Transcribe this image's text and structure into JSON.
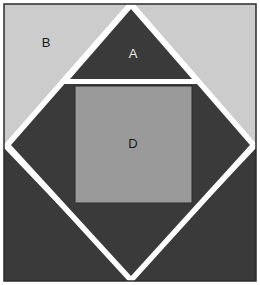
{
  "figure": {
    "width": 260,
    "height": 285,
    "background_color": "#ffffff",
    "frame": {
      "name": "outer-frame",
      "x": 4,
      "y": 4,
      "width": 252,
      "height": 277,
      "stroke_color": "#2b2b2b",
      "stroke_width": 1.5,
      "fill_color": "#ffffff"
    },
    "colors": {
      "light_gray": "#cccccc",
      "dark_gray": "#3a3a3a",
      "medium_gray": "#9a9a9a",
      "gap_white": "#ffffff",
      "outline": "#2b2b2b",
      "label_light": "#e8e8e8",
      "label_dark": "#1a1a1a"
    },
    "regions": [
      {
        "id": "corner-top-left",
        "name": "corner-top-left-triangle",
        "label": "B",
        "fill": "#cccccc",
        "points": "4,4 131,4 4,148",
        "label_x": 46,
        "label_y": 44,
        "label_color": "#1a1a1a"
      },
      {
        "id": "corner-top-right",
        "name": "corner-top-right-triangle",
        "label": "",
        "fill": "#cccccc",
        "points": "131,4 256,4 256,148",
        "label_x": 0,
        "label_y": 0,
        "label_color": "#1a1a1a"
      },
      {
        "id": "corner-bottom-left",
        "name": "corner-bottom-left-triangle",
        "label": "",
        "fill": "#3a3a3a",
        "points": "4,148 4,281 131,281",
        "label_x": 0,
        "label_y": 0,
        "label_color": "#e8e8e8"
      },
      {
        "id": "corner-bottom-right",
        "name": "corner-bottom-right-triangle",
        "label": "",
        "fill": "#3a3a3a",
        "points": "256,148 256,281 131,281",
        "label_x": 0,
        "label_y": 0,
        "label_color": "#e8e8e8"
      },
      {
        "id": "inner-diamond",
        "name": "inner-rotated-square",
        "label": "",
        "fill": "#3a3a3a",
        "points": "131,8 250,145 131,276 11,145",
        "label_x": 0,
        "label_y": 0,
        "label_color": "#e8e8e8"
      },
      {
        "id": "triangle-a",
        "name": "triangle-a",
        "label": "A",
        "fill": "#3a3a3a",
        "points": "131,9 192,79 70,79",
        "label_x": 133,
        "label_y": 55,
        "label_color": "#e8e8e8"
      },
      {
        "id": "square-d",
        "name": "square-d",
        "label": "D",
        "fill": "#9a9a9a",
        "points": "75,86 192,86 192,203 75,203",
        "label_x": 133,
        "label_y": 145,
        "label_color": "#1a1a1a"
      }
    ],
    "labels": {
      "a": "A",
      "b": "B",
      "d": "D"
    }
  }
}
